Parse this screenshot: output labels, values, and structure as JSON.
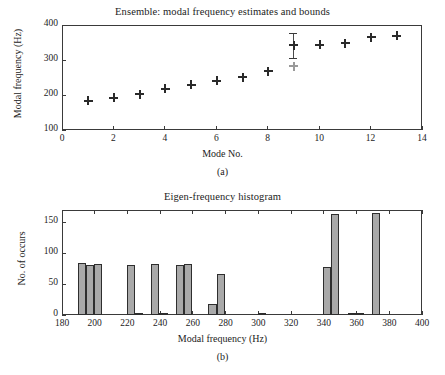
{
  "figure": {
    "panels": [
      {
        "tag": "(a)",
        "title": "Ensemble: modal frequency estimates and bounds",
        "xlabel": "Mode No.",
        "ylabel": "Modal frequency (Hz)"
      },
      {
        "tag": "(b)",
        "title": "Eigen-frequency histogram",
        "xlabel": "Modal frequency (Hz)",
        "ylabel": "No. of occurs"
      }
    ]
  },
  "colors": {
    "bar_fill": "#a9a9a9",
    "bar_edge": "#2e2e2e",
    "marker": "#2a2a2a",
    "ghost_marker": "#9a9a9a",
    "axis": "#3a3a3a",
    "background": "#ffffff"
  },
  "chart_data": [
    {
      "type": "scatter",
      "panel": "(a)",
      "title": "Ensemble: modal frequency estimates and bounds",
      "xlabel": "Mode No.",
      "ylabel": "Modal frequency (Hz)",
      "xlim": [
        0,
        14
      ],
      "ylim": [
        100,
        400
      ],
      "xticks": [
        0,
        2,
        4,
        6,
        8,
        10,
        12,
        14
      ],
      "xticklabels": [
        "0",
        "2",
        "4",
        "6",
        "8",
        "10",
        "12",
        "14"
      ],
      "yticks": [
        100,
        200,
        300,
        400
      ],
      "yticklabels": [
        "100",
        "200",
        "300",
        "400"
      ],
      "grid": false,
      "legend": null,
      "x": [
        1,
        2,
        3,
        4,
        5,
        6,
        7,
        8,
        9,
        10,
        11,
        12,
        13
      ],
      "y": [
        185,
        193,
        203,
        220,
        231,
        242,
        252,
        269,
        344,
        345,
        350,
        367,
        371
      ],
      "error_low": [
        182,
        190,
        200,
        217,
        228,
        239,
        250,
        261,
        303,
        342,
        345,
        365,
        369
      ],
      "error_high": [
        188,
        197,
        207,
        224,
        234,
        246,
        255,
        276,
        378,
        348,
        356,
        370,
        374
      ],
      "outlier_points": [
        {
          "x": 9,
          "y": 283
        }
      ],
      "series_note": "Marker = modal frequency estimate; vertical bars = ensemble bounds"
    },
    {
      "type": "bar",
      "panel": "(b)",
      "title": "Eigen-frequency histogram",
      "xlabel": "Modal frequency (Hz)",
      "ylabel": "No. of occurs",
      "xlim": [
        180,
        400
      ],
      "ylim": [
        0,
        170
      ],
      "xticks": [
        180,
        200,
        220,
        240,
        260,
        280,
        300,
        320,
        340,
        360,
        380,
        400
      ],
      "xticklabels": [
        "180",
        "200",
        "220",
        "240",
        "260",
        "280",
        "300",
        "320",
        "340",
        "360",
        "380",
        "400"
      ],
      "yticks": [
        0,
        50,
        100,
        150
      ],
      "yticklabels": [
        "0",
        "50",
        "100",
        "150"
      ],
      "grid": false,
      "bin_width": 5,
      "bin_centers": [
        192,
        197,
        202,
        207,
        212,
        217,
        222,
        227,
        232,
        237,
        242,
        247,
        252,
        257,
        262,
        267,
        272,
        277,
        282,
        287,
        292,
        297,
        302,
        307,
        312,
        317,
        322,
        327,
        332,
        337,
        342,
        347,
        352,
        357,
        362,
        367,
        372,
        377,
        382
      ],
      "values": [
        85,
        81,
        83,
        0,
        0,
        0,
        81,
        3,
        0,
        83,
        2,
        0,
        81,
        83,
        0,
        0,
        18,
        66,
        0,
        0,
        0,
        0,
        1,
        0,
        0,
        0,
        0,
        0,
        0,
        0,
        78,
        164,
        0,
        3,
        1,
        0,
        165,
        0,
        0
      ]
    }
  ]
}
